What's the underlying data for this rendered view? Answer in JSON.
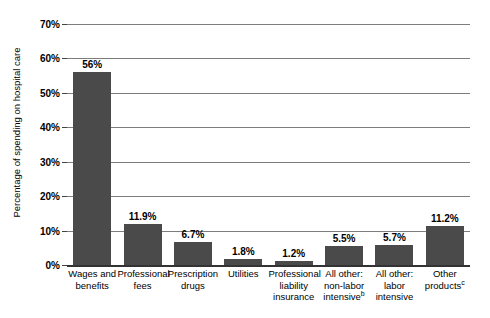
{
  "chart_data": {
    "type": "bar",
    "title": "",
    "xlabel": "",
    "ylabel": "Percentage of spending on hospital care",
    "ylim": [
      0,
      70
    ],
    "grid": true,
    "legend": "none",
    "orientation": "vertical",
    "bar_color": "#4a4a4a",
    "gridline_color": "#7d7d7d",
    "axis_color": "#333333",
    "ytick_labels": [
      "70%",
      "60%",
      "50%",
      "40%",
      "30%",
      "20%",
      "10%",
      "0%"
    ],
    "ytick_values": [
      70,
      60,
      50,
      40,
      30,
      20,
      10,
      0
    ],
    "categories": [
      "Wages and benefits",
      "Professional fees",
      "Prescription drugs",
      "Utilities",
      "Professional liability insurance",
      "All other: non-labor intensive",
      "All other: labor intensive",
      "Other products"
    ],
    "category_lines": [
      [
        "Wages and",
        "benefits"
      ],
      [
        "Professional",
        "fees"
      ],
      [
        "Prescription",
        "drugs"
      ],
      [
        "Utilities"
      ],
      [
        "Professional",
        "liability",
        "insurance"
      ],
      [
        "All other:",
        "non-labor",
        "intensive"
      ],
      [
        "All other:",
        "labor",
        "intensive"
      ],
      [
        "Other",
        "products"
      ]
    ],
    "category_footnotes": [
      "",
      "",
      "",
      "",
      "",
      "b",
      "",
      "c"
    ],
    "values": [
      56,
      11.9,
      6.7,
      1.8,
      1.2,
      5.5,
      5.7,
      11.2
    ],
    "value_labels": [
      "56%",
      "11.9%",
      "6.7%",
      "1.8%",
      "1.2%",
      "5.5%",
      "5.7%",
      "11.2%"
    ]
  }
}
